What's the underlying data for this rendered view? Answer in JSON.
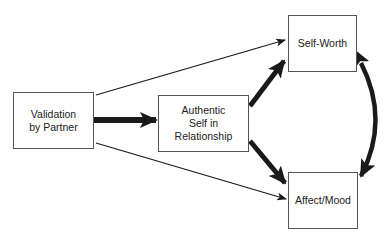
{
  "diagram": {
    "nodes": [
      {
        "id": "validation",
        "label": "Validation\nby Partner"
      },
      {
        "id": "authentic",
        "label": "Authentic\nSelf in\nRelationship"
      },
      {
        "id": "self_worth",
        "label": "Self-Worth"
      },
      {
        "id": "affect",
        "label": "Affect/Mood"
      }
    ],
    "edges": [
      {
        "from": "validation",
        "to": "authentic",
        "weight": "thick"
      },
      {
        "from": "validation",
        "to": "self_worth",
        "weight": "thin"
      },
      {
        "from": "validation",
        "to": "affect",
        "weight": "thin"
      },
      {
        "from": "authentic",
        "to": "self_worth",
        "weight": "thick"
      },
      {
        "from": "authentic",
        "to": "affect",
        "weight": "thick"
      },
      {
        "from": "self_worth",
        "to": "affect",
        "weight": "thick",
        "bidirectional": true,
        "curved": true
      }
    ],
    "colors": {
      "stroke": "#1a1a1a",
      "box_border": "#555555",
      "background": "#ffffff"
    }
  }
}
